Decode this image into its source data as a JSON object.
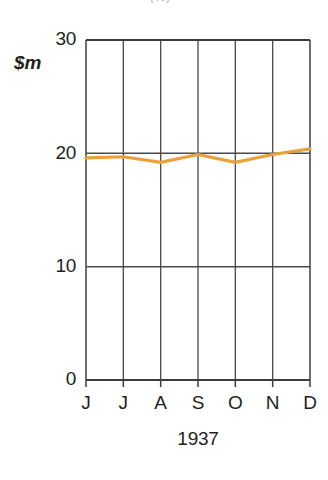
{
  "figure": {
    "clipped_title": "(%)",
    "unit_label": "$m",
    "xaxis_title": "1937"
  },
  "colors": {
    "series_line": "#E9A13B",
    "axis": "#3b3b3b",
    "gridline": "#4a4a4a",
    "text": "#231f20",
    "background": "#ffffff"
  },
  "chart_data": {
    "type": "line",
    "title": "",
    "xlabel": "1937",
    "ylabel": "$m",
    "categories": [
      "J",
      "J",
      "A",
      "S",
      "O",
      "N",
      "D"
    ],
    "x_tick_labels": [
      "J",
      "J",
      "A",
      "S",
      "O",
      "N",
      "D"
    ],
    "y_tick_labels": [
      "0",
      "10",
      "20",
      "30"
    ],
    "y_ticks": [
      0,
      10,
      20,
      30
    ],
    "ylim": [
      0,
      30
    ],
    "grid": true,
    "legend": false,
    "series": [
      {
        "name": "$m",
        "color": "#E9A13B",
        "values": [
          19.6,
          19.7,
          19.2,
          19.9,
          19.2,
          19.9,
          20.4
        ]
      }
    ]
  }
}
